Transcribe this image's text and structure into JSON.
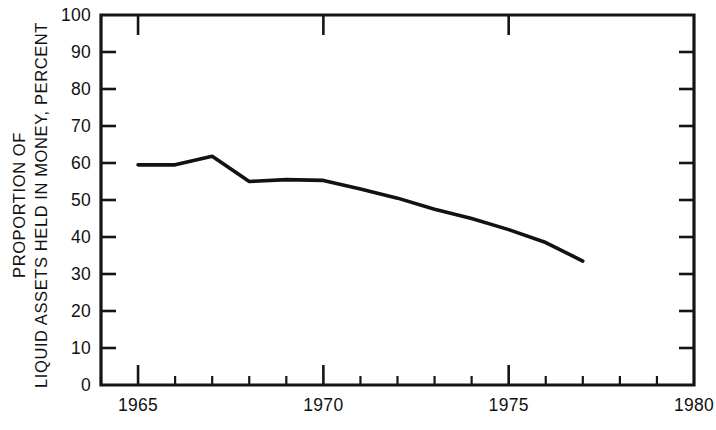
{
  "chart_data": {
    "type": "line",
    "title": "",
    "subtitle": "",
    "xlabel": "",
    "ylabel_line1": "PROPORTION OF",
    "ylabel_line2": "LIQUID ASSETS HELD IN MONEY, PERCENT",
    "x": [
      1965,
      1966,
      1967,
      1968,
      1969,
      1970,
      1971,
      1972,
      1973,
      1974,
      1975,
      1976,
      1977
    ],
    "values": [
      59.5,
      59.5,
      61.8,
      55.0,
      55.5,
      55.3,
      53.0,
      50.5,
      47.5,
      45.0,
      42.0,
      38.5,
      33.5
    ],
    "series": [
      {
        "name": "Proportion of liquid assets held in money",
        "values": [
          59.5,
          59.5,
          61.8,
          55.0,
          55.5,
          55.3,
          53.0,
          50.5,
          47.5,
          45.0,
          42.0,
          38.5,
          33.5
        ],
        "color": "#121212"
      }
    ],
    "xlim": [
      1964,
      1980
    ],
    "ylim": [
      0,
      100
    ],
    "x_major_ticks": [
      1965,
      1970,
      1975,
      1980
    ],
    "x_major_tick_labels": [
      "1965",
      "1970",
      "1975",
      "1980"
    ],
    "x_minor_tick_step": 1,
    "y_ticks": [
      0,
      10,
      20,
      30,
      40,
      50,
      60,
      70,
      80,
      90,
      100
    ],
    "y_tick_labels": [
      "0",
      "10",
      "20",
      "30",
      "40",
      "50",
      "60",
      "70",
      "80",
      "90",
      "100"
    ],
    "grid": false,
    "legend": "none",
    "frame": "box",
    "line_color": "#121212",
    "axis_color": "#151515",
    "background_color": "#ffffff"
  }
}
